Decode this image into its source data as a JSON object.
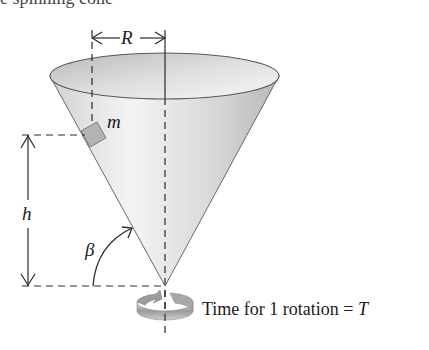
{
  "figure": {
    "caption_partial": "e spinning cone",
    "labels": {
      "radius": "R",
      "mass": "m",
      "height": "h",
      "angle": "β",
      "rotation_text": "Time for 1 rotation = ",
      "period_symbol": "T"
    },
    "elements": [
      "cone",
      "rotation-axis",
      "block-mass",
      "radius-dimension",
      "height-dimension",
      "angle-arc",
      "rotation-arrow-icon"
    ],
    "colors": {
      "line": "#2a2a2a",
      "cone_fill_light": "#f2f2f2",
      "cone_fill_dark": "#bdbdbd",
      "mass_fill": "#b0b0b0",
      "rim_inner": "#c9c9c9"
    }
  }
}
